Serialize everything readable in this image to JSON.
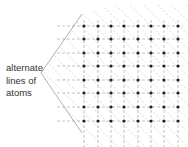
{
  "annotation": {
    "lines": [
      "alternate",
      "lines of",
      "atoms"
    ]
  },
  "lattice": {
    "columns_x": [
      84,
      98,
      111,
      124,
      138,
      151,
      164,
      178
    ],
    "rows_y": [
      26,
      39,
      53,
      66,
      80,
      93,
      107,
      121
    ],
    "atom_color": "#222222",
    "grid_line_color": "#9a9a9a",
    "diagonal_line_color": "#b5b5b5",
    "bracket_color": "#9a9a9a"
  }
}
